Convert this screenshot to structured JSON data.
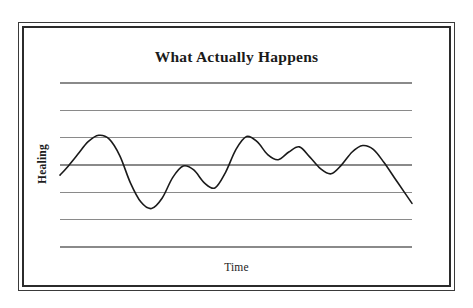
{
  "figure": {
    "title": "What Actually Happens",
    "y_axis_label": "Healing",
    "x_axis_label": "Time",
    "colors": {
      "background": "#ffffff",
      "frame_outer": "#3a3a3a",
      "frame_inner": "#2b2b2b",
      "gridline": "#8a8a8a",
      "curve": "#1a1a1a",
      "text": "#1b1b1b"
    }
  },
  "chart_data": {
    "type": "line",
    "title": "What Actually Happens",
    "subtitle": "",
    "xlabel": "Time",
    "ylabel": "Healing",
    "xlim": [
      0,
      100
    ],
    "ylim": [
      0,
      100
    ],
    "grid": true,
    "grid_orientation": "horizontal",
    "gridline_count": 7,
    "gridline_y_values": [
      100,
      83.3,
      66.7,
      50,
      33.3,
      16.7,
      0
    ],
    "axis_tick_labels": [],
    "legend": null,
    "legend_position": "none",
    "annotations": [],
    "series": [
      {
        "name": "Healing progress",
        "smooth": true,
        "x": [
          0,
          2,
          5,
          8,
          11,
          14,
          17,
          20,
          23,
          26,
          29,
          32,
          35,
          38,
          41,
          44,
          47,
          50,
          53,
          56,
          59,
          62,
          65,
          68,
          71,
          74,
          77,
          80,
          83,
          86,
          89,
          92,
          95,
          98,
          100
        ],
        "y": [
          40,
          46,
          56,
          66,
          71,
          68,
          55,
          34,
          19,
          14,
          22,
          38,
          47,
          44,
          34,
          30,
          42,
          60,
          70,
          66,
          56,
          52,
          58,
          62,
          54,
          45,
          41,
          48,
          58,
          63,
          60,
          50,
          38,
          26,
          18
        ]
      }
    ],
    "points_peaks": [
      {
        "x": 11,
        "y": 71,
        "label": "first high"
      },
      {
        "x": 27,
        "y": 13,
        "label": "first crash low"
      },
      {
        "x": 63,
        "y": 15,
        "label": "second crash low"
      },
      {
        "x": 70,
        "y": 86,
        "label": "highest peak"
      },
      {
        "x": 100,
        "y": 74,
        "label": "end rising"
      }
    ]
  }
}
